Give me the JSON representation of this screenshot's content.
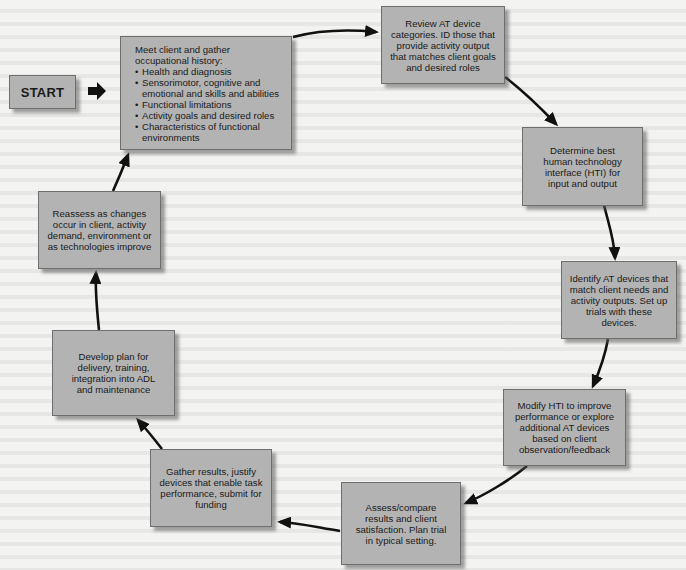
{
  "diagram": {
    "type": "flowchart-cycle",
    "colors": {
      "box_fill": "#b3b3b3",
      "box_border": "#6e6e6e",
      "arrow": "#111111",
      "background": "#f3f3f1"
    },
    "start": {
      "label": "START"
    },
    "steps": [
      {
        "id": "meet-client",
        "heading": "Meet client and gather occupational history:",
        "bullets": [
          "Health and diagnosis",
          "Sensorimotor, cognitive and emotional and skills and abilities",
          "Functional limitations",
          "Activity goals and desired roles",
          "Characteristics of functional environments"
        ]
      },
      {
        "id": "review-at",
        "text": "Review AT device categories. ID those that provide activity output that matches client goals and desired roles"
      },
      {
        "id": "determine-hti",
        "text": "Determine best human technology interface (HTI) for input and output"
      },
      {
        "id": "identify-at",
        "text": "Identify AT devices that match client needs and activity outputs. Set up trials with these devices."
      },
      {
        "id": "modify-hti",
        "text": "Modify HTI to improve performance or explore additional AT devices based on client observation/feedback"
      },
      {
        "id": "assess-compare",
        "text": "Assess/compare results and client satisfaction. Plan trial in typical setting."
      },
      {
        "id": "gather-results",
        "text": "Gather results, justify devices that enable task performance, submit for funding"
      },
      {
        "id": "develop-plan",
        "text": "Develop plan for delivery, training, integration into ADL and maintenance"
      },
      {
        "id": "reassess",
        "text": "Reassess as changes occur in client, activity demand, environment or as technologies improve"
      }
    ],
    "edges": [
      [
        "start",
        "meet-client"
      ],
      [
        "meet-client",
        "review-at"
      ],
      [
        "review-at",
        "determine-hti"
      ],
      [
        "determine-hti",
        "identify-at"
      ],
      [
        "identify-at",
        "modify-hti"
      ],
      [
        "modify-hti",
        "assess-compare"
      ],
      [
        "assess-compare",
        "gather-results"
      ],
      [
        "gather-results",
        "develop-plan"
      ],
      [
        "develop-plan",
        "reassess"
      ],
      [
        "reassess",
        "meet-client"
      ]
    ]
  }
}
